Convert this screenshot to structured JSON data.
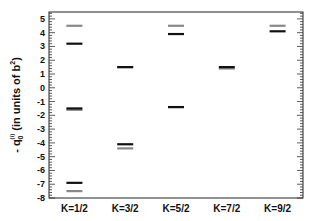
{
  "chart_data": {
    "type": "scatter",
    "title": "",
    "xlabel": "",
    "ylabel": "- q0^(i) (in units of b^2)",
    "ylabel_parts": {
      "prefix": "- q",
      "sub": "0",
      "sup": "(i)",
      "units": "(in units of b",
      "units_sup": "2",
      "units_close": ")"
    },
    "ylim": [
      -8,
      5.5
    ],
    "yticks": [
      5,
      4,
      3,
      2,
      1,
      0,
      -1,
      -2,
      -3,
      -4,
      -5,
      -6,
      -7,
      -8
    ],
    "grid": false,
    "legend": null,
    "categories": [
      "K=1/2",
      "K=3/2",
      "K=5/2",
      "K=7/2",
      "K=9/2"
    ],
    "series": [
      {
        "name": "black levels",
        "color": "#111111",
        "values": [
          [
            3.2,
            -1.5,
            -6.9
          ],
          [
            1.5,
            -4.1
          ],
          [
            3.9,
            -1.4
          ],
          [
            1.5
          ],
          [
            4.1
          ]
        ]
      },
      {
        "name": "gray levels",
        "color": "#888888",
        "values": [
          [
            4.5,
            -1.6,
            -7.5
          ],
          [
            1.5,
            -4.4
          ],
          [
            4.5,
            -1.4
          ],
          [
            1.4
          ],
          [
            4.5
          ]
        ]
      }
    ]
  }
}
